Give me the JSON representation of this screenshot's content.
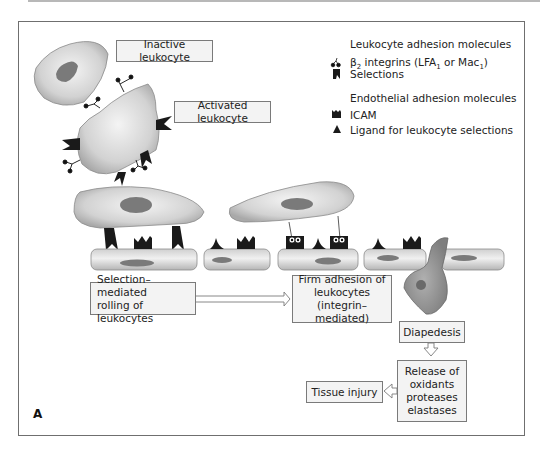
{
  "figure": {
    "panel_letter": "A"
  },
  "cells": {
    "inactive_label": "Inactive leukocyte",
    "activated_label": "Activated leukocyte"
  },
  "legend": {
    "leukocyte_heading": "Leukocyte adhesion molecules",
    "integrins_prefix": "β",
    "integrins_sub": "2",
    "integrins_text": " integrins (LFA",
    "integrins_sub2": "1",
    "integrins_mid": " or Mac",
    "integrins_sub3": "1",
    "integrins_end": ")",
    "selections": "Selections",
    "endothelial_heading": "Endothelial adhesion molecules",
    "icam": "ICAM",
    "ligand": "Ligand for leukocyte selections"
  },
  "steps": {
    "rolling_line1": "Selection–mediated",
    "rolling_line2": "rolling of leukocytes",
    "adhesion_line1": "Firm adhesion of",
    "adhesion_line2": "leukocytes",
    "adhesion_line3": "(integrin–mediated)",
    "diapedesis": "Diapedesis",
    "release_line1": "Release of",
    "release_line2": "oxidants",
    "release_line3": "proteases",
    "release_line4": "elastases",
    "tissue_injury": "Tissue injury"
  },
  "colors": {
    "cell_fill": "#d4d4d4",
    "nucleus": "#7a7a7a",
    "molecule": "#1a1a1a",
    "frame": "#6f6f6f",
    "label_bg": "#f3f3f3"
  }
}
